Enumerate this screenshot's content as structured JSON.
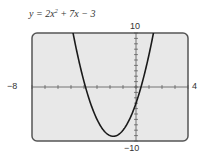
{
  "chart_data": {
    "type": "line",
    "equation": {
      "a": 2,
      "b": 7,
      "c": -3
    },
    "xlim": [
      -8,
      4
    ],
    "ylim": [
      -10,
      10
    ],
    "x_tick_step": 1,
    "y_tick_step": 1,
    "axis_labels": {
      "xmin": "-8",
      "xmax": "4",
      "ymax": "10",
      "ymin": "-10"
    },
    "grid": false,
    "series": [
      {
        "name": "y = 2x^2 + 7x - 3",
        "color": "#1a1a1a"
      }
    ]
  },
  "labels": {
    "title_prefix": "y = 2x",
    "title_exp": "2",
    "title_suffix": " + 7x − 3",
    "xmin": "−8",
    "xmax": "4",
    "ymax": "10",
    "ymin": "−10"
  },
  "colors": {
    "screen": "#e8e8e8",
    "border": "#555555",
    "curve": "#1a1a1a"
  }
}
